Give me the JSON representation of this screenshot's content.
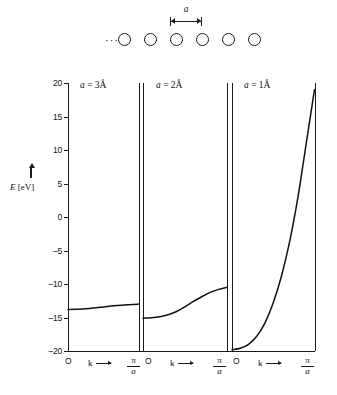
{
  "chain": {
    "atom_count": 6,
    "atom_icon": "circle-atom",
    "bond_style": "dotted",
    "left_ellipsis": "···",
    "right_ellipsis": "···",
    "spacing_label": "a"
  },
  "yaxis": {
    "label_symbol": "E",
    "label_unit": "[eV]",
    "ticks": [
      "20",
      "15",
      "10",
      "5",
      "0",
      "–5",
      "–10",
      "–15",
      "–20"
    ],
    "tick_values": [
      20,
      15,
      10,
      5,
      0,
      -5,
      -10,
      -15,
      -20
    ],
    "min": -20,
    "max": 20,
    "step": 5
  },
  "xaxis": {
    "origin_label": "O",
    "variable_label": "k",
    "max_label_numerator": "π",
    "max_label_denominator": "a"
  },
  "panels": [
    {
      "label_prefix": "a",
      "label_eq": "=",
      "label_value": "3Å"
    },
    {
      "label_prefix": "a",
      "label_eq": "=",
      "label_value": "2Å"
    },
    {
      "label_prefix": "a",
      "label_eq": "=",
      "label_value": "1Å"
    }
  ],
  "colors": {
    "ink": "#1a1a1a",
    "background": "#ffffff",
    "curve": "#111111"
  },
  "chart_data": {
    "type": "line",
    "xlabel": "k",
    "ylabel": "E [eV]",
    "ylim": [
      -20,
      20
    ],
    "xlim_label": [
      "O",
      "π/a"
    ],
    "grid": false,
    "legend": "none",
    "panel_count": 3,
    "series": [
      {
        "name": "a = 3Å",
        "panel": 1,
        "x": [
          0,
          0.1,
          0.2,
          0.3,
          0.4,
          0.5,
          0.6,
          0.7,
          0.8,
          0.9,
          1.0
        ],
        "values": [
          -13.8,
          -13.78,
          -13.73,
          -13.65,
          -13.55,
          -13.42,
          -13.3,
          -13.2,
          -13.12,
          -13.05,
          -13.0
        ],
        "band_bottom": -13.8,
        "band_top": -13.0,
        "bandwidth": 0.8
      },
      {
        "name": "a = 2Å",
        "panel": 2,
        "x": [
          0,
          0.1,
          0.2,
          0.3,
          0.4,
          0.5,
          0.6,
          0.7,
          0.8,
          0.9,
          1.0
        ],
        "values": [
          -15.1,
          -15.05,
          -14.9,
          -14.6,
          -14.1,
          -13.4,
          -12.6,
          -11.9,
          -11.25,
          -10.8,
          -10.5
        ],
        "band_bottom": -15.1,
        "band_top": -10.5,
        "bandwidth": 4.6
      },
      {
        "name": "a = 1Å",
        "panel": 3,
        "x": [
          0,
          0.1,
          0.2,
          0.3,
          0.4,
          0.5,
          0.6,
          0.7,
          0.8,
          0.9,
          1.0
        ],
        "values": [
          -19.8,
          -19.6,
          -19.0,
          -17.8,
          -15.8,
          -12.8,
          -8.8,
          -3.6,
          3.0,
          11.0,
          19.0
        ],
        "band_bottom": -19.8,
        "band_top": 19.0,
        "bandwidth": 38.8
      }
    ]
  }
}
